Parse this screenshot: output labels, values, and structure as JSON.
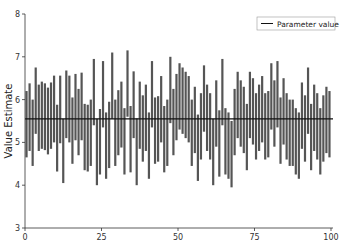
{
  "chart_data": {
    "type": "bar",
    "subtype": "interval-bars",
    "title": "",
    "xlabel": "",
    "ylabel": "Value Estimate",
    "xlim": [
      0,
      100
    ],
    "ylim": [
      3,
      8
    ],
    "xticks": [
      0,
      25,
      50,
      75,
      100
    ],
    "yticks": [
      3,
      4,
      5,
      6,
      7,
      8
    ],
    "grid": false,
    "legend": {
      "position": "upper right",
      "entries": [
        "Parameter value"
      ]
    },
    "parameter_value": 5.55,
    "bar_color": "#555555",
    "line_color": "#111111",
    "intervals": [
      [
        4.65,
        6.2
      ],
      [
        4.8,
        6.38
      ],
      [
        4.45,
        6.0
      ],
      [
        5.2,
        6.75
      ],
      [
        4.8,
        6.35
      ],
      [
        4.85,
        6.42
      ],
      [
        4.82,
        6.38
      ],
      [
        4.72,
        6.28
      ],
      [
        4.85,
        6.4
      ],
      [
        5.0,
        6.56
      ],
      [
        4.32,
        5.88
      ],
      [
        4.98,
        6.56
      ],
      [
        4.05,
        5.55
      ],
      [
        5.1,
        6.68
      ],
      [
        5.0,
        6.56
      ],
      [
        4.5,
        6.05
      ],
      [
        5.05,
        6.6
      ],
      [
        4.7,
        6.25
      ],
      [
        5.05,
        6.63
      ],
      [
        4.35,
        5.9
      ],
      [
        4.32,
        5.88
      ],
      [
        4.45,
        6.0
      ],
      [
        5.4,
        6.95
      ],
      [
        4.0,
        5.55
      ],
      [
        4.25,
        5.78
      ],
      [
        5.35,
        6.9
      ],
      [
        4.15,
        5.7
      ],
      [
        4.4,
        5.95
      ],
      [
        5.55,
        7.1
      ],
      [
        4.45,
        6.0
      ],
      [
        4.7,
        6.22
      ],
      [
        4.88,
        6.42
      ],
      [
        4.25,
        5.8
      ],
      [
        5.6,
        7.15
      ],
      [
        4.3,
        5.85
      ],
      [
        5.1,
        6.66
      ],
      [
        4.0,
        5.56
      ],
      [
        4.85,
        6.42
      ],
      [
        4.55,
        6.1
      ],
      [
        4.8,
        6.35
      ],
      [
        4.15,
        5.7
      ],
      [
        5.35,
        6.9
      ],
      [
        4.5,
        6.05
      ],
      [
        4.55,
        6.08
      ],
      [
        5.0,
        6.55
      ],
      [
        4.3,
        5.85
      ],
      [
        4.45,
        6.0
      ],
      [
        5.45,
        7.0
      ],
      [
        4.7,
        6.25
      ],
      [
        5.05,
        6.6
      ],
      [
        5.3,
        6.85
      ],
      [
        5.2,
        6.75
      ],
      [
        5.1,
        6.65
      ],
      [
        5.0,
        6.55
      ],
      [
        4.45,
        6.0
      ],
      [
        4.75,
        6.3
      ],
      [
        4.1,
        5.65
      ],
      [
        4.6,
        6.15
      ],
      [
        5.25,
        6.8
      ],
      [
        4.8,
        6.35
      ],
      [
        4.6,
        6.15
      ],
      [
        4.0,
        5.55
      ],
      [
        4.9,
        6.45
      ],
      [
        4.2,
        5.75
      ],
      [
        5.4,
        6.95
      ],
      [
        4.25,
        5.8
      ],
      [
        4.15,
        5.7
      ],
      [
        3.95,
        5.5
      ],
      [
        4.7,
        6.25
      ],
      [
        5.1,
        6.65
      ],
      [
        4.9,
        6.45
      ],
      [
        4.75,
        6.3
      ],
      [
        4.35,
        5.9
      ],
      [
        5.1,
        6.65
      ],
      [
        4.95,
        6.5
      ],
      [
        4.6,
        6.15
      ],
      [
        4.8,
        6.35
      ],
      [
        5.0,
        6.55
      ],
      [
        4.6,
        6.15
      ],
      [
        4.65,
        6.2
      ],
      [
        5.3,
        6.85
      ],
      [
        4.9,
        6.45
      ],
      [
        5.35,
        6.9
      ],
      [
        4.5,
        6.05
      ],
      [
        4.95,
        6.5
      ],
      [
        4.6,
        6.15
      ],
      [
        4.45,
        6.0
      ],
      [
        4.45,
        6.0
      ],
      [
        4.25,
        5.8
      ],
      [
        4.15,
        5.7
      ],
      [
        4.85,
        6.4
      ],
      [
        4.55,
        6.1
      ],
      [
        5.2,
        6.75
      ],
      [
        4.35,
        5.9
      ],
      [
        4.8,
        6.35
      ],
      [
        4.6,
        6.15
      ],
      [
        4.25,
        5.8
      ],
      [
        4.55,
        6.1
      ],
      [
        4.75,
        6.3
      ],
      [
        4.65,
        6.2
      ]
    ]
  }
}
